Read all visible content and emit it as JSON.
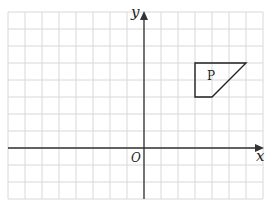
{
  "diagram": {
    "grid": {
      "origin_px": [
        144,
        148
      ],
      "cell_px": 17,
      "x_range": [
        -8,
        7
      ],
      "y_range": [
        -3,
        8
      ],
      "line_color": "#d8d8d8",
      "axis_color": "#333333"
    },
    "axes": {
      "x_label": "x",
      "y_label": "y",
      "origin_label": "O"
    },
    "shapes": [
      {
        "label": "P",
        "vertices": [
          [
            3,
            5
          ],
          [
            6,
            5
          ],
          [
            4,
            3
          ],
          [
            3,
            3
          ]
        ],
        "stroke": "#222222"
      }
    ]
  }
}
